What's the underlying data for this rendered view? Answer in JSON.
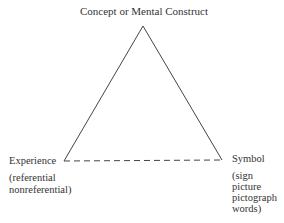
{
  "diagram": {
    "type": "semiotic-triangle",
    "apex_label": "Concept or Mental Construct",
    "left_label": "Experience",
    "left_sub": [
      "(referential",
      "nonreferential)"
    ],
    "right_label": "Symbol",
    "right_sub": [
      "(sign",
      "picture",
      "pictograph",
      "words)"
    ],
    "edges": [
      {
        "from": "Concept or Mental Construct",
        "to": "Experience",
        "style": "solid"
      },
      {
        "from": "Concept or Mental Construct",
        "to": "Symbol",
        "style": "solid"
      },
      {
        "from": "Experience",
        "to": "Symbol",
        "style": "dashed"
      }
    ],
    "line_color": "#444444"
  }
}
